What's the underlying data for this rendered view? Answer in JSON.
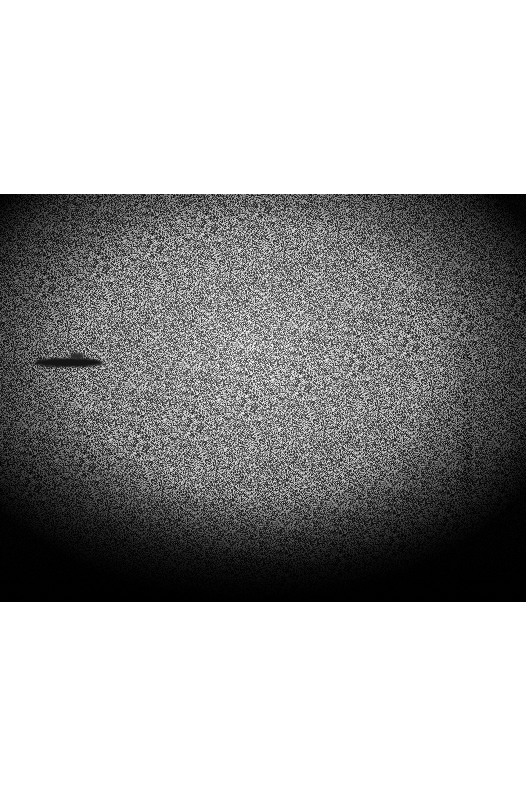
{
  "image": {
    "description": "Grainy black-and-white photograph with heavy noise and dark vignette; a dark elongated object floats on the left side of the frame",
    "frame": {
      "x": 0,
      "y": 194,
      "width": 526,
      "height": 408
    },
    "background_color": "#ffffff",
    "tone": {
      "center_gray": "#9a9a9a",
      "edge_gray": "#0a0a0a",
      "noise_amplitude": 95
    },
    "objects": [
      {
        "name": "dark-elongated-object",
        "x": 35,
        "y": 358,
        "width": 68,
        "height": 9,
        "color": "#141414",
        "superstructure": {
          "x": 70,
          "y": 353,
          "width": 14,
          "height": 6
        }
      },
      {
        "name": "dark-speck",
        "x": 331,
        "y": 548,
        "width": 6,
        "height": 6,
        "color": "#1a1a1a"
      }
    ]
  }
}
